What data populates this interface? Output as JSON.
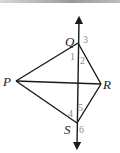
{
  "diagram": {
    "points": {
      "P": {
        "label": "P"
      },
      "Q": {
        "label": "Q"
      },
      "R": {
        "label": "R"
      },
      "S": {
        "label": "S"
      }
    },
    "segments": [
      "PQ",
      "QR",
      "PR",
      "PS",
      "RS"
    ],
    "line": {
      "through": [
        "Q",
        "S"
      ],
      "arrows": "both"
    },
    "angle_labels": [
      "1",
      "2",
      "3",
      "4",
      "5",
      "6"
    ],
    "colors": {
      "lines": "#1a1a1a",
      "angle_numbers": "#8a8a8a"
    }
  }
}
